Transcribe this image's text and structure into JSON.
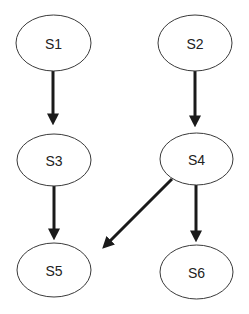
{
  "diagram": {
    "type": "directed-graph",
    "nodes": [
      {
        "id": "S1",
        "label": "S1"
      },
      {
        "id": "S2",
        "label": "S2"
      },
      {
        "id": "S3",
        "label": "S3"
      },
      {
        "id": "S4",
        "label": "S4"
      },
      {
        "id": "S5",
        "label": "S5"
      },
      {
        "id": "S6",
        "label": "S6"
      }
    ],
    "edges": [
      {
        "from": "S1",
        "to": "S3"
      },
      {
        "from": "S2",
        "to": "S4"
      },
      {
        "from": "S3",
        "to": "S5"
      },
      {
        "from": "S4",
        "to": "S5"
      },
      {
        "from": "S4",
        "to": "S6"
      }
    ],
    "colors": {
      "stroke": "#3a3a3a",
      "arrow": "#1a1a1a",
      "background": "#ffffff"
    }
  }
}
